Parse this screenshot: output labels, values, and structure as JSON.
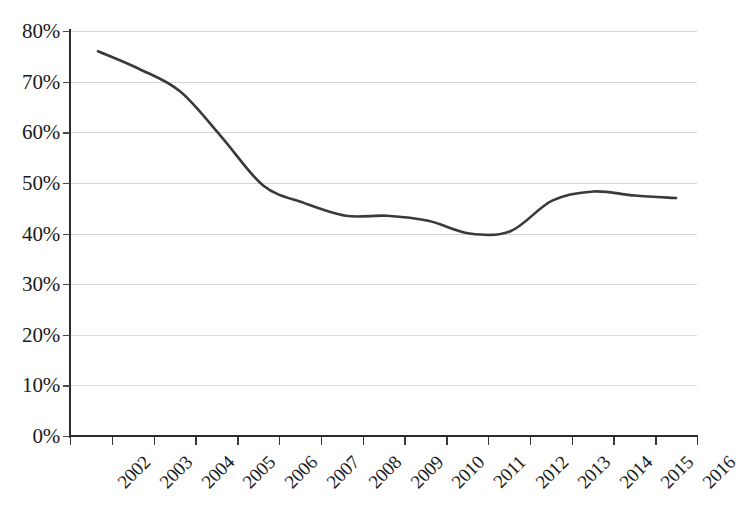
{
  "chart_data": {
    "type": "line",
    "title": "",
    "subtitle": "",
    "xlabel": "",
    "ylabel": "",
    "categories": [
      "2002",
      "2003",
      "2004",
      "2005",
      "2006",
      "2007",
      "2008",
      "2009",
      "2010",
      "2011",
      "2012",
      "2013",
      "2014",
      "2015",
      "2016"
    ],
    "x": [
      2002,
      2003,
      2004,
      2005,
      2006,
      2007,
      2008,
      2009,
      2010,
      2011,
      2012,
      2013,
      2014,
      2015,
      2016
    ],
    "series": [
      {
        "name": "",
        "values": [
          76.0,
          72.5,
          68.0,
          59.0,
          49.5,
          46.0,
          43.5,
          43.5,
          42.5,
          40.0,
          40.5,
          46.5,
          48.3,
          47.5,
          47.0
        ]
      }
    ],
    "ylim": [
      0,
      80
    ],
    "ytick_values": [
      0,
      10,
      20,
      30,
      40,
      50,
      60,
      70,
      80
    ],
    "ytick_labels": [
      "0%",
      "10%",
      "20%",
      "30%",
      "40%",
      "50%",
      "60%",
      "70%",
      "80%"
    ],
    "xtick_labels": [
      "2002",
      "2003",
      "2004",
      "2005",
      "2006",
      "2007",
      "2008",
      "2009",
      "2010",
      "2011",
      "2012",
      "2013",
      "2014",
      "2015",
      "2016"
    ],
    "grid": true,
    "grid_axis": "y",
    "legend": false,
    "legend_position": "none",
    "line_color": "#3a3a3a",
    "grid_color": "#d4d4d4",
    "axis_color": "#2b2b2b",
    "background_color": "#ffffff",
    "markers": false,
    "smooth": true,
    "annotations": []
  }
}
